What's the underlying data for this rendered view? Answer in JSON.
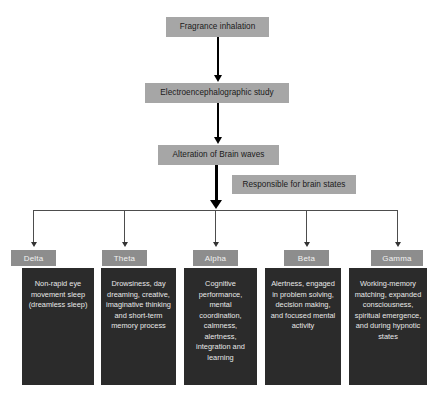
{
  "flow": {
    "steps": [
      {
        "id": "fragrance",
        "label": "Fragrance inhalation"
      },
      {
        "id": "eeg",
        "label": "Electroencephalographic study"
      },
      {
        "id": "alteration",
        "label": "Alteration of Brain waves"
      }
    ],
    "side_note": {
      "id": "responsible",
      "label": "Responsible for brain states"
    }
  },
  "brain_waves": [
    {
      "name": "Delta",
      "description": "Non-rapid eye movement sleep (dreamless sleep)"
    },
    {
      "name": "Theta",
      "description": "Drowsiness, day dreaming, creative, imaginative thinking and short-term memory process"
    },
    {
      "name": "Alpha",
      "description": "Cognitive performance, mental coordination, calmness, alertness, integration and learning"
    },
    {
      "name": "Beta",
      "description": "Alertness, engaged in problem solving, decision making, and focused mental activity"
    },
    {
      "name": "Gamma",
      "description": "Working-memory matching, expanded consciousness, spiritual emergence, and during hypnotic states"
    }
  ],
  "colors": {
    "header_box": "#a6a6a6",
    "label_box": "#8d8d8d",
    "body_box": "#2b2b2b",
    "connector": "#000000",
    "background": "#ffffff"
  }
}
